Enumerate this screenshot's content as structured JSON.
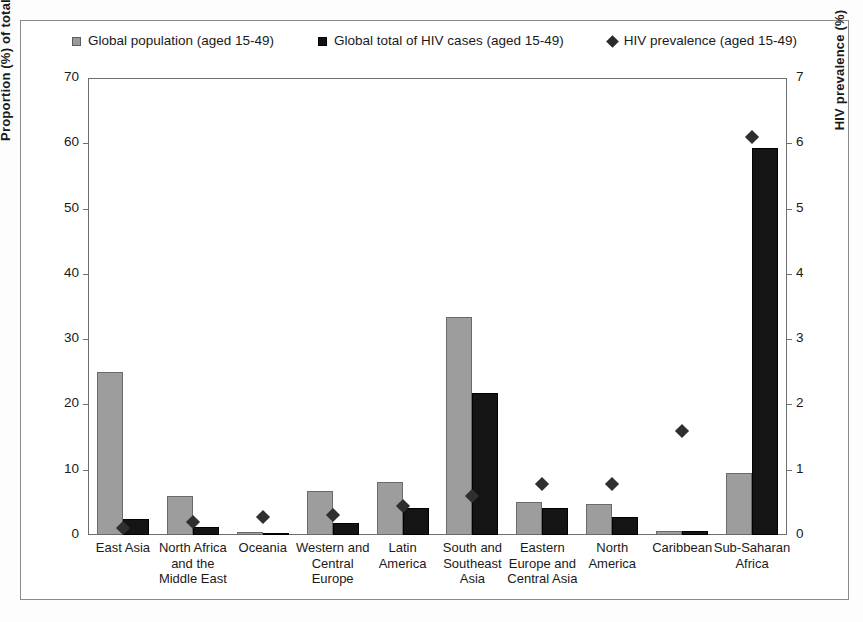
{
  "chart_data": {
    "type": "bar",
    "title": "",
    "subtitle": "",
    "xlabel": "",
    "ylabel": "Proportion (%) of total",
    "y2label": "HIV prevalence (%)",
    "ylim": [
      0,
      70
    ],
    "y2lim": [
      0,
      7
    ],
    "yticks": [
      0,
      10,
      20,
      30,
      40,
      50,
      60,
      70
    ],
    "y2ticks": [
      0,
      1,
      2,
      3,
      4,
      5,
      6,
      7
    ],
    "grid": false,
    "legend_position": "top",
    "categories": [
      "East Asia",
      "North Africa and the Middle East",
      "Oceania",
      "Western and Central Europe",
      "Latin America",
      "South and Southeast Asia",
      "Eastern Europe and Central Asia",
      "North America",
      "Caribbean",
      "Sub-Saharan Africa"
    ],
    "category_lines": [
      [
        "East Asia"
      ],
      [
        "North Africa",
        "and the",
        "Middle East"
      ],
      [
        "Oceania"
      ],
      [
        "Western and",
        "Central",
        "Europe"
      ],
      [
        "Latin",
        "America"
      ],
      [
        "South and",
        "Southeast",
        "Asia"
      ],
      [
        "Eastern",
        "Europe and",
        "Central Asia"
      ],
      [
        "North",
        "America"
      ],
      [
        "Caribbean"
      ],
      [
        "Sub-Saharan",
        "Africa"
      ]
    ],
    "series": [
      {
        "name": "Global population (aged 15-49)",
        "axis": "left",
        "type": "bar",
        "color": "#9d9d9d",
        "values": [
          24.9,
          5.9,
          0.5,
          6.7,
          8.1,
          33.4,
          5.0,
          4.7,
          0.6,
          9.5
        ]
      },
      {
        "name": "Global total of HIV cases (aged 15-49)",
        "axis": "left",
        "type": "bar",
        "color": "#141414",
        "values": [
          2.4,
          1.2,
          0.1,
          1.9,
          4.2,
          21.8,
          4.1,
          2.8,
          0.6,
          59.3
        ]
      },
      {
        "name": "HIV prevalence (aged 15-49)",
        "axis": "right",
        "type": "scatter",
        "color": "#2f2f2f",
        "values": [
          0.1,
          0.2,
          0.28,
          0.3,
          0.45,
          0.6,
          0.78,
          0.78,
          1.6,
          6.1
        ]
      }
    ]
  },
  "legend": {
    "items": [
      {
        "label": "Global population (aged 15-49)",
        "marker": "square-gray"
      },
      {
        "label": "Global total of HIV cases (aged 15-49)",
        "marker": "square-black"
      },
      {
        "label": "HIV prevalence (aged 15-49)",
        "marker": "diamond-black"
      }
    ]
  }
}
